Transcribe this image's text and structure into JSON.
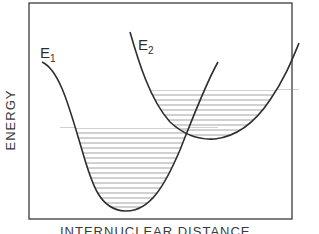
{
  "diagram": {
    "type": "potential-energy-curves",
    "y_axis_label": "ENERGY",
    "x_axis_label": "INTERNUCLEAR DISTANCE",
    "curves": [
      {
        "name": "E",
        "subscript": "1",
        "description": "lower potential well with vibrational levels"
      },
      {
        "name": "E",
        "subscript": "2",
        "description": "upper, displaced potential well with vibrational levels"
      }
    ],
    "colors": {
      "line": "#2e2e2e",
      "hatch": "#8a8a8a",
      "background": "#ffffff"
    }
  }
}
